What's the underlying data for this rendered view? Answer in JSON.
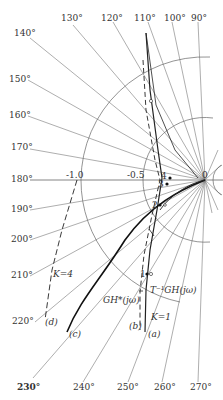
{
  "diagram": {
    "type": "polar-plot",
    "origin_label": "0",
    "radial_labels": [
      {
        "text": "-1.0",
        "value": -1.0
      },
      {
        "text": "-0.5",
        "value": -0.5
      }
    ],
    "angle_labels": [
      {
        "text": "90°",
        "deg": 90
      },
      {
        "text": "100°",
        "deg": 100
      },
      {
        "text": "110°",
        "deg": 110
      },
      {
        "text": "120°",
        "deg": 120
      },
      {
        "text": "130°",
        "deg": 130
      },
      {
        "text": "140°",
        "deg": 140
      },
      {
        "text": "150°",
        "deg": 150
      },
      {
        "text": "160°",
        "deg": 160
      },
      {
        "text": "170°",
        "deg": 170
      },
      {
        "text": "180°",
        "deg": 180
      },
      {
        "text": "190°",
        "deg": 190
      },
      {
        "text": "200°",
        "deg": 200
      },
      {
        "text": "210°",
        "deg": 210
      },
      {
        "text": "220°",
        "deg": 220
      },
      {
        "text": "230°",
        "deg": 230
      },
      {
        "text": "240°",
        "deg": 240
      },
      {
        "text": "250°",
        "deg": 250
      },
      {
        "text": "260°",
        "deg": 260
      },
      {
        "text": "270°",
        "deg": 270
      }
    ],
    "curves": [
      {
        "id": "a",
        "label": "(a)",
        "style": "solid"
      },
      {
        "id": "b",
        "label": "(b)",
        "style": "dashed"
      },
      {
        "id": "c",
        "label": "(c)",
        "style": "solid-bold"
      },
      {
        "id": "d",
        "label": "(d)",
        "style": "dashed"
      }
    ],
    "annotations": {
      "k4": "K=4",
      "k1": "K=1",
      "ghstar": "GH*(jω)",
      "tinv": "T⁻¹GH(jω)"
    },
    "points": [
      "1",
      "2",
      "3",
      "4"
    ]
  }
}
